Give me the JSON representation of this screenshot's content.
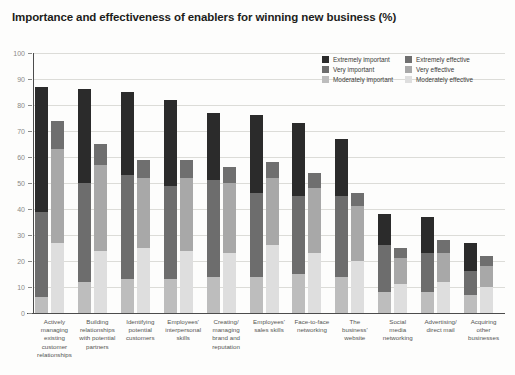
{
  "title": "Importance and effectiveness of enablers for winning new business (%)",
  "legend": {
    "position": "top-right",
    "items": [
      {
        "label": "Extremely important",
        "color": "#2b2b2b",
        "key": "extremely_important"
      },
      {
        "label": "Extremely effective",
        "color": "#6f6f6f",
        "key": "extremely_effective"
      },
      {
        "label": "Very important",
        "color": "#6d6d6d",
        "key": "very_important"
      },
      {
        "label": "Very effective",
        "color": "#a8a8a8",
        "key": "very_effective"
      },
      {
        "label": "Moderately important",
        "color": "#bdbdbd",
        "key": "moderately_important"
      },
      {
        "label": "Moderately effective",
        "color": "#dedede",
        "key": "moderately_effective"
      }
    ]
  },
  "yaxis": {
    "ticks": [
      "0",
      "10",
      "20",
      "30",
      "40",
      "50",
      "60",
      "70",
      "80",
      "90",
      "100"
    ],
    "min": 0,
    "max": 100
  },
  "chart_data": {
    "type": "bar",
    "title": "Importance and effectiveness of enablers for winning new business (%)",
    "xlabel": "",
    "ylabel": "",
    "ylim": [
      0,
      100
    ],
    "grid": true,
    "stacked": true,
    "grouped_pairs": [
      "importance",
      "effectiveness"
    ],
    "categories": [
      "Actively managing existing customer relationships",
      "Building relationships with potential partners",
      "Identifying potential customers",
      "Employees' interpersonal skills",
      "Creating/ managing brand and reputation",
      "Employees' sales skills",
      "Face-to-face networking",
      "The business' website",
      "Social media networking",
      "Advertising/ direct mail",
      "Acquiring other businesses"
    ],
    "category_lines": [
      [
        "Actively",
        "managing",
        "existing",
        "customer",
        "relationships"
      ],
      [
        "Building",
        "relationships",
        "with potential",
        "partners"
      ],
      [
        "Identifying",
        "potential",
        "customers"
      ],
      [
        "Employees'",
        "interpersonal",
        "skills"
      ],
      [
        "Creating/",
        "managing",
        "brand and",
        "reputation"
      ],
      [
        "Employees'",
        "sales skills"
      ],
      [
        "Face-to-face",
        "networking"
      ],
      [
        "The",
        "business'",
        "website"
      ],
      [
        "Social",
        "media",
        "networking"
      ],
      [
        "Advertising/",
        "direct mail"
      ],
      [
        "Acquiring",
        "other",
        "businesses"
      ]
    ],
    "series": [
      {
        "name": "Extremely important",
        "bar": "importance",
        "values": [
          48,
          36,
          32,
          33,
          26,
          30,
          28,
          22,
          12,
          14,
          11
        ]
      },
      {
        "name": "Very important",
        "bar": "importance",
        "values": [
          33,
          38,
          40,
          36,
          37,
          32,
          30,
          31,
          18,
          15,
          9
        ]
      },
      {
        "name": "Moderately important",
        "bar": "importance",
        "values": [
          6,
          12,
          13,
          13,
          14,
          14,
          15,
          14,
          8,
          8,
          7
        ]
      },
      {
        "name": "Extremely effective",
        "bar": "effectiveness",
        "values": [
          11,
          8,
          7,
          7,
          6,
          6,
          6,
          5,
          4,
          5,
          4
        ]
      },
      {
        "name": "Very effective",
        "bar": "effectiveness",
        "values": [
          36,
          33,
          27,
          28,
          27,
          26,
          25,
          21,
          10,
          11,
          8
        ]
      },
      {
        "name": "Moderately effective",
        "bar": "effectiveness",
        "values": [
          27,
          24,
          25,
          24,
          23,
          26,
          23,
          20,
          11,
          12,
          10
        ]
      }
    ],
    "totals": {
      "importance": [
        87,
        86,
        85,
        82,
        77,
        76,
        73,
        67,
        38,
        37,
        27
      ],
      "effectiveness": [
        74,
        65,
        59,
        59,
        56,
        58,
        54,
        46,
        25,
        28,
        22
      ]
    }
  }
}
